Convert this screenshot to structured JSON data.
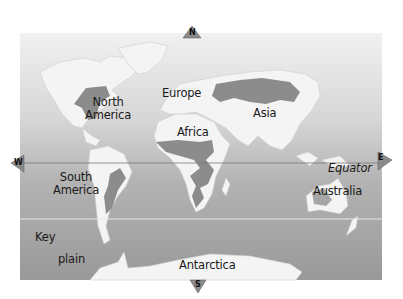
{
  "map": {
    "compass": {
      "north": "N",
      "south": "S",
      "west": "W",
      "east": "E"
    },
    "continents": [
      {
        "id": "north-america",
        "label_line1": "North",
        "label_line2": "America"
      },
      {
        "id": "south-america",
        "label_line1": "South",
        "label_line2": "America"
      },
      {
        "id": "europe",
        "label": "Europe"
      },
      {
        "id": "africa",
        "label": "Africa"
      },
      {
        "id": "asia",
        "label": "Asia"
      },
      {
        "id": "australia",
        "label": "Australia"
      },
      {
        "id": "antarctica",
        "label": "Antarctica"
      }
    ],
    "equator_label": "Equator",
    "key": {
      "title": "Key",
      "items": [
        {
          "label": "plain"
        }
      ]
    },
    "colors": {
      "ocean_top": "#ececec",
      "ocean_bottom": "#9a9a9a",
      "land": "#f3f3f3",
      "plain": "#8a8a8a",
      "equator_line": "#7a7a7a",
      "tropic_line": "#e6e6e6"
    }
  }
}
